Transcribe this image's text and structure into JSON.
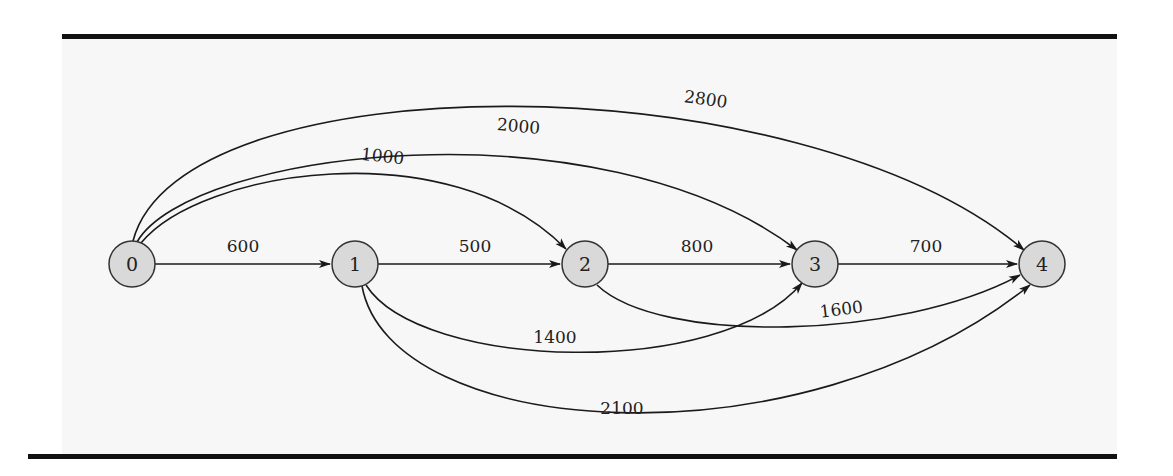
{
  "diagram": {
    "type": "directed-graph",
    "colors": {
      "panel_background": "#f7f7f7",
      "border_line": "#111111",
      "node_fill": "#d9d9d9",
      "node_stroke": "#333333",
      "edge_stroke": "#1a1a1a"
    },
    "nodes": [
      {
        "id": "0",
        "label": "0",
        "x": 132,
        "y": 264
      },
      {
        "id": "1",
        "label": "1",
        "x": 355,
        "y": 264
      },
      {
        "id": "2",
        "label": "2",
        "x": 585,
        "y": 264
      },
      {
        "id": "3",
        "label": "3",
        "x": 815,
        "y": 264
      },
      {
        "id": "4",
        "label": "4",
        "x": 1042,
        "y": 264
      }
    ],
    "edges": [
      {
        "from": "0",
        "to": "1",
        "weight": "600",
        "path": "M155,264 L330,264",
        "label_x": 243,
        "label_y": 252,
        "label_rot": 0
      },
      {
        "from": "1",
        "to": "2",
        "weight": "500",
        "path": "M378,264 L560,264",
        "label_x": 475,
        "label_y": 252,
        "label_rot": 0
      },
      {
        "from": "2",
        "to": "3",
        "weight": "800",
        "path": "M608,264 L790,264",
        "label_x": 697,
        "label_y": 252,
        "label_rot": 0
      },
      {
        "from": "3",
        "to": "4",
        "weight": "700",
        "path": "M838,264 L1017,264",
        "label_x": 926,
        "label_y": 252,
        "label_rot": 0
      },
      {
        "from": "0",
        "to": "2",
        "weight": "1000",
        "path": "M141,243 C200,170 450,130 566,249",
        "label_x": 382,
        "label_y": 162,
        "label_rot": 6
      },
      {
        "from": "0",
        "to": "3",
        "weight": "2000",
        "path": "M137,242 C190,150 600,100 797,250",
        "label_x": 518,
        "label_y": 132,
        "label_rot": 5
      },
      {
        "from": "0",
        "to": "4",
        "weight": "2800",
        "path": "M133,241 C180,60 800,60 1024,250",
        "label_x": 705,
        "label_y": 105,
        "label_rot": 8
      },
      {
        "from": "1",
        "to": "3",
        "weight": "1400",
        "path": "M366,285 C420,370 720,380 802,283",
        "label_x": 555,
        "label_y": 343,
        "label_rot": 0
      },
      {
        "from": "2",
        "to": "4",
        "weight": "1600",
        "path": "M597,285 C660,345 900,340 1020,275",
        "label_x": 842,
        "label_y": 315,
        "label_rot": -7
      },
      {
        "from": "1",
        "to": "4",
        "weight": "2100",
        "path": "M362,286 C390,440 800,470 1030,285",
        "label_x": 622,
        "label_y": 414,
        "label_rot": 0
      }
    ]
  }
}
